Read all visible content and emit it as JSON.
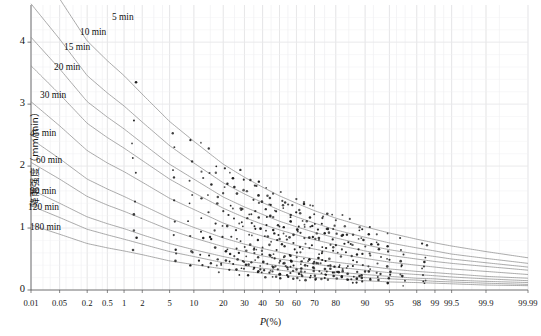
{
  "chart_data": {
    "type": "scatter",
    "title": "",
    "xlabel": "P(%)",
    "xlabel_italic": "P",
    "xlabel_pct": "(%)",
    "ylabel": "降雨强度（mm/min）",
    "x_scale": "normal-probability",
    "xlim": [
      0.01,
      99.99
    ],
    "ylim": [
      0,
      4.6
    ],
    "ytick_labels": [
      "0",
      "1",
      "2",
      "3",
      "4"
    ],
    "ytick_values": [
      0,
      1,
      2,
      3,
      4
    ],
    "xtick_labels": [
      "0.01",
      "0.05",
      "0.2",
      "0.5",
      "1",
      "2",
      "5",
      "10",
      "20",
      "30",
      "40",
      "50",
      "60",
      "70",
      "80",
      "90",
      "95",
      "98",
      "99",
      "99.5",
      "99.9",
      "99.99"
    ],
    "xtick_values": [
      0.01,
      0.05,
      0.2,
      0.5,
      1,
      2,
      5,
      10,
      20,
      30,
      40,
      50,
      60,
      70,
      80,
      90,
      95,
      98,
      99,
      99.5,
      99.9,
      99.99
    ],
    "grid": true,
    "legend": "inline-curve-labels",
    "curve_color": "#8d8d8d",
    "point_color": "#1a1a1a",
    "grid_color": "#e9e9ec",
    "axis_color": "#555555",
    "series": [
      {
        "name": "5 min",
        "label": "5 min",
        "label_x": 112,
        "label_y": 12,
        "values": [
          5.35,
          4.7,
          4.02,
          3.7,
          3.46,
          3.16,
          2.72,
          2.4,
          2.03,
          1.82,
          1.66,
          1.52,
          1.4,
          1.28,
          1.16,
          1.02,
          0.92,
          0.82,
          0.76,
          0.71,
          0.62,
          0.52
        ]
      },
      {
        "name": "10 min",
        "label": "10 min",
        "label_x": 80,
        "label_y": 27,
        "values": [
          4.62,
          4.05,
          3.46,
          3.18,
          2.97,
          2.71,
          2.33,
          2.05,
          1.73,
          1.55,
          1.41,
          1.29,
          1.18,
          1.08,
          0.97,
          0.85,
          0.76,
          0.68,
          0.63,
          0.58,
          0.51,
          0.43
        ]
      },
      {
        "name": "15 min",
        "label": "15 min",
        "label_x": 64,
        "label_y": 42,
        "values": [
          4.08,
          3.57,
          3.04,
          2.79,
          2.6,
          2.37,
          2.03,
          1.79,
          1.5,
          1.34,
          1.22,
          1.11,
          1.02,
          0.93,
          0.84,
          0.73,
          0.65,
          0.58,
          0.54,
          0.5,
          0.44,
          0.37
        ]
      },
      {
        "name": "20 min",
        "label": "20 min",
        "label_x": 54,
        "label_y": 62,
        "values": [
          3.62,
          3.16,
          2.69,
          2.46,
          2.29,
          2.09,
          1.79,
          1.57,
          1.32,
          1.17,
          1.06,
          0.97,
          0.89,
          0.81,
          0.73,
          0.63,
          0.56,
          0.5,
          0.46,
          0.43,
          0.38,
          0.32
        ]
      },
      {
        "name": "30 min",
        "label": "30 min",
        "label_x": 40,
        "label_y": 90,
        "values": [
          3.04,
          2.65,
          2.25,
          2.05,
          1.91,
          1.74,
          1.48,
          1.3,
          1.08,
          0.96,
          0.87,
          0.79,
          0.72,
          0.66,
          0.59,
          0.51,
          0.45,
          0.4,
          0.37,
          0.34,
          0.3,
          0.25
        ]
      },
      {
        "name": "45 min",
        "label": "45 min",
        "label_x": 30,
        "label_y": 128,
        "values": [
          2.44,
          2.12,
          1.79,
          1.63,
          1.51,
          1.37,
          1.16,
          1.01,
          0.84,
          0.74,
          0.67,
          0.61,
          0.55,
          0.5,
          0.45,
          0.39,
          0.34,
          0.3,
          0.28,
          0.26,
          0.22,
          0.19
        ]
      },
      {
        "name": "60 min",
        "label": "60 min",
        "label_x": 36,
        "label_y": 155,
        "values": [
          2.06,
          1.79,
          1.51,
          1.37,
          1.27,
          1.15,
          0.97,
          0.84,
          0.7,
          0.62,
          0.55,
          0.5,
          0.46,
          0.42,
          0.37,
          0.32,
          0.28,
          0.25,
          0.23,
          0.21,
          0.18,
          0.15
        ]
      },
      {
        "name": "90 min",
        "label": "90 min",
        "label_x": 30,
        "label_y": 186,
        "values": [
          1.62,
          1.4,
          1.18,
          1.07,
          0.99,
          0.89,
          0.75,
          0.65,
          0.54,
          0.47,
          0.43,
          0.39,
          0.35,
          0.32,
          0.29,
          0.25,
          0.22,
          0.19,
          0.18,
          0.16,
          0.14,
          0.12
        ]
      },
      {
        "name": "120 min",
        "label": "120 min",
        "label_x": 28,
        "label_y": 202,
        "values": [
          1.36,
          1.17,
          0.98,
          0.89,
          0.82,
          0.74,
          0.62,
          0.54,
          0.44,
          0.39,
          0.35,
          0.32,
          0.29,
          0.26,
          0.24,
          0.2,
          0.18,
          0.16,
          0.14,
          0.13,
          0.11,
          0.09
        ]
      },
      {
        "name": "180 min",
        "label": "180 min",
        "label_x": 30,
        "label_y": 222,
        "values": [
          1.05,
          0.9,
          0.75,
          0.68,
          0.63,
          0.57,
          0.47,
          0.41,
          0.34,
          0.3,
          0.27,
          0.24,
          0.22,
          0.2,
          0.18,
          0.15,
          0.13,
          0.12,
          0.11,
          0.1,
          0.08,
          0.07
        ]
      }
    ]
  }
}
